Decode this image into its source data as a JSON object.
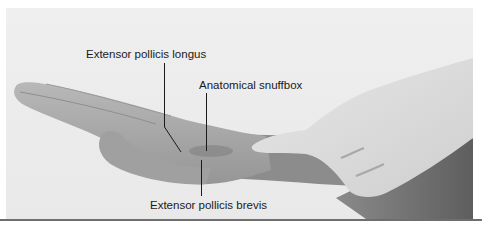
{
  "figure": {
    "labels": {
      "epl": "Extensor pollicis longus",
      "snuffbox": "Anatomical snuffbox",
      "epb": "Extensor pollicis brevis"
    },
    "colors": {
      "background": "#ebebeb",
      "skin_subject": "#a9a9a9",
      "skin_examiner": "#dcdcdc",
      "forearm_shadow": "#6f6f6f",
      "leader_line": "#1a1a1a",
      "bottom_rule": "#6e6e6e"
    }
  }
}
